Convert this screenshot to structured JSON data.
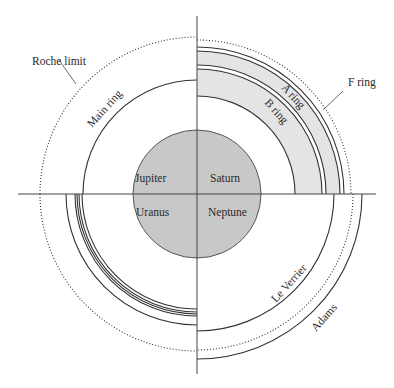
{
  "diagram": {
    "center": {
      "x": 197,
      "y": 194
    },
    "planet_radius": 64,
    "colors": {
      "planet_fill": "#c8c8c8",
      "ring_fill": "#e4e4e4",
      "line": "#333333"
    },
    "quadrants": {
      "jupiter": {
        "planet": "Jupiter",
        "rings": [
          {
            "name": "Main ring",
            "r": 114
          }
        ],
        "roche_limit": {
          "label": "Roche limit",
          "r": 157
        }
      },
      "saturn": {
        "planet": "Saturn",
        "rings": [
          {
            "name": "B ring",
            "r_in": 98,
            "r_out": 125
          },
          {
            "name": "A ring",
            "r_in": 129,
            "r_out": 143
          },
          {
            "name": "F ring",
            "r": 147
          }
        ],
        "roche_limit_r": 154
      },
      "uranus": {
        "planet": "Uranus",
        "rings_r": [
          115,
          118,
          120,
          122,
          124,
          131
        ],
        "roche_limit_r": 157
      },
      "neptune": {
        "planet": "Neptune",
        "rings": [
          {
            "name": "Le Verrier",
            "r": 137
          },
          {
            "name": "Adams",
            "r": 165
          }
        ],
        "roche_limit_r": 156
      }
    },
    "labels": {
      "jupiter": "Jupiter",
      "saturn": "Saturn",
      "uranus": "Uranus",
      "neptune": "Neptune",
      "roche_limit": "Roche limit",
      "main_ring": "Main ring",
      "a_ring": "A ring",
      "b_ring": "B ring",
      "f_ring": "F ring",
      "le_verrier": "Le Verrier",
      "adams": "Adams"
    }
  }
}
